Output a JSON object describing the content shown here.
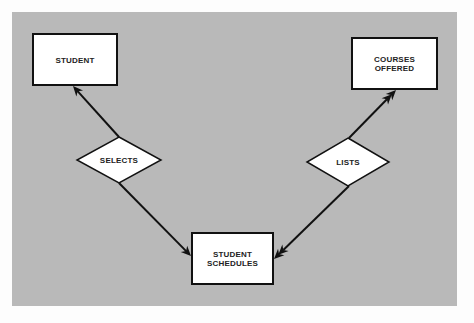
{
  "diagram": {
    "type": "entity-relationship",
    "background": "#fdfdfd",
    "panel": {
      "x": 12,
      "y": 12,
      "width": 445,
      "height": 294,
      "color": "#b9b9b9"
    },
    "entities": [
      {
        "id": "student",
        "label_lines": [
          "STUDENT"
        ],
        "x": 33,
        "y": 34,
        "width": 84,
        "height": 51
      },
      {
        "id": "courses_offered",
        "label_lines": [
          "COURSES",
          "OFFERED"
        ],
        "x": 352,
        "y": 38,
        "width": 85,
        "height": 51
      },
      {
        "id": "student_schedules",
        "label_lines": [
          "STUDENT",
          "SCHEDULES"
        ],
        "x": 192,
        "y": 233,
        "width": 81,
        "height": 51
      }
    ],
    "relationships": [
      {
        "id": "selects",
        "label": "SELECTS",
        "cx": 119,
        "cy": 160,
        "half_width": 42,
        "half_height": 23
      },
      {
        "id": "lists",
        "label": "LISTS",
        "cx": 348,
        "cy": 162,
        "half_width": 41,
        "half_height": 24
      }
    ],
    "connectors": [
      {
        "from": "selects",
        "to": "student",
        "x1": 119,
        "y1": 137,
        "x2": 73,
        "y2": 86,
        "arrowheads": 1
      },
      {
        "from": "lists",
        "to": "courses_offered",
        "x1": 349,
        "y1": 138,
        "x2": 396,
        "y2": 90,
        "arrowheads": 2
      },
      {
        "from": "selects",
        "to": "student_schedules",
        "x1": 119,
        "y1": 183,
        "x2": 191,
        "y2": 256,
        "arrowheads": 1
      },
      {
        "from": "lists",
        "to": "student_schedules",
        "x1": 349,
        "y1": 186,
        "x2": 274,
        "y2": 259,
        "arrowheads": 2
      }
    ],
    "colors": {
      "node_fill": "#ffffff",
      "stroke": "#111111",
      "text": "#222222"
    }
  }
}
